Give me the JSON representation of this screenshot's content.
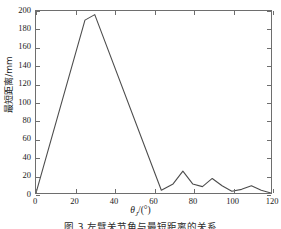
{
  "chart_data": {
    "type": "line",
    "title": "",
    "xlabel": "θ_J/(°)",
    "xlabel_parts": {
      "symbol": "θ",
      "subscript": "J",
      "unit": "/(°)"
    },
    "ylabel": "最短距离/mm",
    "xlim": [
      0,
      120
    ],
    "ylim": [
      0,
      200
    ],
    "xticks": [
      0,
      20,
      40,
      60,
      80,
      100,
      120
    ],
    "yticks": [
      0,
      20,
      40,
      60,
      80,
      100,
      120,
      140,
      160,
      180,
      200
    ],
    "grid": false,
    "legend": null,
    "line_color": "#4d4d4d",
    "series": [
      {
        "name": "最短距离",
        "x": [
          0,
          25,
          30,
          64,
          70,
          75,
          80,
          85,
          90,
          95,
          100,
          105,
          110,
          115,
          120
        ],
        "values": [
          0,
          190,
          196,
          3,
          10,
          24,
          10,
          7,
          16,
          8,
          2,
          4,
          8,
          3,
          0
        ]
      }
    ]
  },
  "axes": {
    "x_tick_labels": [
      "0",
      "20",
      "40",
      "60",
      "80",
      "100",
      "120"
    ],
    "y_tick_labels": [
      "0",
      "20",
      "40",
      "60",
      "80",
      "100",
      "120",
      "140",
      "160",
      "180",
      "200"
    ]
  },
  "caption": {
    "text": "图 3  左臂关节角与最短距离的关系"
  }
}
